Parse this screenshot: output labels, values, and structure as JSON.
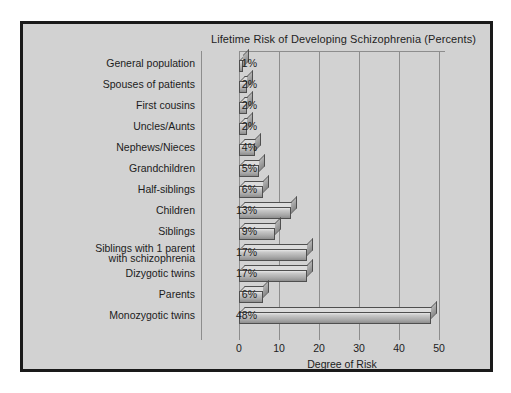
{
  "chart_data": {
    "type": "bar",
    "orientation": "horizontal",
    "title": "Lifetime Risk of Developing Schizophrenia (Percents)",
    "xlabel": "Degree of Risk",
    "ylabel": "",
    "xlim": [
      0,
      50
    ],
    "xticks": [
      0,
      10,
      20,
      30,
      40,
      50
    ],
    "xtick_labels": [
      "0",
      "10",
      "20",
      "30",
      "40",
      "50"
    ],
    "grid": true,
    "legend": "none",
    "categories": [
      "General population",
      "Spouses of patients",
      "First cousins",
      "Uncles/Aunts",
      "Nephews/Nieces",
      "Grandchildren",
      "Half-siblings",
      "Children",
      "Siblings",
      "Siblings with 1 parent with schizophrenia",
      "Dizygotic twins",
      "Parents",
      "Monozygotic twins"
    ],
    "values": [
      1,
      2,
      2,
      2,
      4,
      5,
      6,
      13,
      9,
      17,
      17,
      6,
      48
    ],
    "value_labels": [
      "1%",
      "2%",
      "2%",
      "2%",
      "4%",
      "5%",
      "6%",
      "13%",
      "9%",
      "17%",
      "17%",
      "6%",
      "48%"
    ]
  },
  "rows": [
    {
      "label": "General population",
      "label_line1": "General population",
      "label_line2": "",
      "pct": "1%",
      "value": 1
    },
    {
      "label": "Spouses of patients",
      "label_line1": "Spouses of patients",
      "label_line2": "",
      "pct": "2%",
      "value": 2
    },
    {
      "label": "First cousins",
      "label_line1": "First cousins",
      "label_line2": "",
      "pct": "2%",
      "value": 2
    },
    {
      "label": "Uncles/Aunts",
      "label_line1": "Uncles/Aunts",
      "label_line2": "",
      "pct": "2%",
      "value": 2
    },
    {
      "label": "Nephews/Nieces",
      "label_line1": "Nephews/Nieces",
      "label_line2": "",
      "pct": "4%",
      "value": 4
    },
    {
      "label": "Grandchildren",
      "label_line1": "Grandchildren",
      "label_line2": "",
      "pct": "5%",
      "value": 5
    },
    {
      "label": "Half-siblings",
      "label_line1": "Half-siblings",
      "label_line2": "",
      "pct": "6%",
      "value": 6
    },
    {
      "label": "Children",
      "label_line1": "Children",
      "label_line2": "",
      "pct": "13%",
      "value": 13
    },
    {
      "label": "Siblings",
      "label_line1": "Siblings",
      "label_line2": "",
      "pct": "9%",
      "value": 9
    },
    {
      "label": "Siblings with 1 parent with schizophrenia",
      "label_line1": "Siblings with 1 parent",
      "label_line2": "with schizophrenia",
      "pct": "17%",
      "value": 17
    },
    {
      "label": "Dizygotic twins",
      "label_line1": "Dizygotic twins",
      "label_line2": "",
      "pct": "17%",
      "value": 17
    },
    {
      "label": "Parents",
      "label_line1": "Parents",
      "label_line2": "",
      "pct": "6%",
      "value": 6
    },
    {
      "label": "Monozygotic twins",
      "label_line1": "Monozygotic twins",
      "label_line2": "",
      "pct": "48%",
      "value": 48
    }
  ],
  "colors": {
    "background": "#d2d2d2",
    "frame": "#1a1a1a",
    "grid": "#8d8d8d",
    "bar_face": "#c0c0c0",
    "bar_edge": "#4f4f4f",
    "text": "#1c1c1c"
  }
}
